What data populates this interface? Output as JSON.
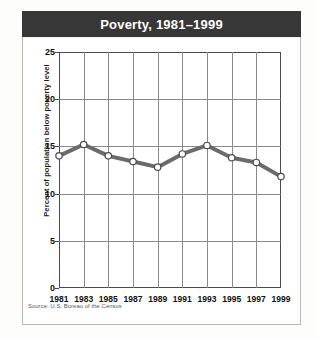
{
  "panel": {
    "title": "Poverty, 1981–1999",
    "source_note": "Source: U.S. Bureau of the Census"
  },
  "chart_data": {
    "type": "line",
    "title": "Poverty, 1981–1999",
    "xlabel": "",
    "ylabel": "Percent of population below poverty level",
    "categories": [
      "1981",
      "1983",
      "1985",
      "1987",
      "1989",
      "1991",
      "1993",
      "1995",
      "1997",
      "1999"
    ],
    "values": [
      14.0,
      15.2,
      14.0,
      13.4,
      12.8,
      14.2,
      15.1,
      13.8,
      13.3,
      11.8
    ],
    "ylim": [
      0,
      25
    ],
    "yticks": [
      0,
      5,
      10,
      15,
      20,
      25
    ],
    "ytick_labels": [
      "0",
      "5",
      "10",
      "15",
      "20",
      "25"
    ],
    "grid": true,
    "legend": "none",
    "marker": "open-circle",
    "line_color": "#6b6b6b",
    "marker_fill": "#ffffff",
    "marker_stroke": "#4a4a4a"
  }
}
